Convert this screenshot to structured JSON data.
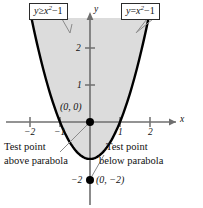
{
  "figure": {
    "title_region": "graph of the inequality y >= x^2 - 1 with test points",
    "labels": {
      "inequality_box": {
        "lhs": "y",
        "rel": "≥",
        "var": "x",
        "exp": "2",
        "minus": "−",
        "const": "1"
      },
      "equation_box": {
        "lhs": "y",
        "rel": "=",
        "var": "x",
        "exp": "2",
        "minus": "−",
        "const": "1"
      }
    },
    "axes": {
      "x_axis_name": "x",
      "y_axis_name": "y",
      "x_ticks": [
        {
          "label": "−2",
          "value": -2
        },
        {
          "label": "−1",
          "value": -1
        },
        {
          "label": "1",
          "value": 1
        },
        {
          "label": "2",
          "value": 2
        }
      ],
      "y_ticks": [
        {
          "label": "2",
          "value": 2
        },
        {
          "label": "1",
          "value": 1
        },
        {
          "label": "−2",
          "value": -2
        }
      ]
    },
    "points": [
      {
        "label": "(0, 0)",
        "x": 0,
        "y": 0,
        "role": "test-point-above-parabola"
      },
      {
        "label": "(0, −2)",
        "x": 0,
        "y": -2,
        "role": "test-point-below-parabola"
      }
    ],
    "annotations": {
      "above": {
        "line1": "Test point",
        "line2": "above parabola"
      },
      "below": {
        "line1": "Test point",
        "line2": "below parabola"
      }
    },
    "colors": {
      "shade": "#dcdcdc",
      "curve": "#000000",
      "axis": "#6f6f6f",
      "box_border": "#2b2b2b",
      "leader": "#8a8a8a",
      "text": "#111111",
      "background": "#ffffff"
    }
  },
  "chart_data": {
    "type": "line",
    "title": "",
    "xlabel": "x",
    "ylabel": "y",
    "xlim": [
      -3.0,
      3.2
    ],
    "ylim": [
      -2.8,
      2.6
    ],
    "grid": false,
    "legend": "boxed labels at top",
    "series": [
      {
        "name": "y = x^2 - 1",
        "type": "parabola",
        "equation": "y = x^2 - 1",
        "vertex": [
          0,
          -1
        ],
        "roots": [
          -1,
          1
        ],
        "x": [
          -1.8,
          -1.5,
          -1.25,
          -1.0,
          -0.75,
          -0.5,
          -0.25,
          0,
          0.25,
          0.5,
          0.75,
          1.0,
          1.25,
          1.5,
          1.8
        ],
        "values": [
          2.24,
          1.25,
          0.5625,
          0,
          -0.4375,
          -0.75,
          -0.9375,
          -1,
          -0.9375,
          -0.75,
          -0.4375,
          0,
          0.5625,
          1.25,
          2.24
        ]
      }
    ],
    "shaded_region": {
      "name": "y ≥ x^2 - 1",
      "inequality": "y >= x^2 - 1",
      "fill": "#dcdcdc",
      "description": "region on or above the parabola"
    },
    "annotated_points": [
      {
        "label": "(0, 0)",
        "x": 0,
        "y": 0,
        "note": "Test point above parabola"
      },
      {
        "label": "(0, −2)",
        "x": 0,
        "y": -2,
        "note": "Test point below parabola"
      }
    ]
  }
}
